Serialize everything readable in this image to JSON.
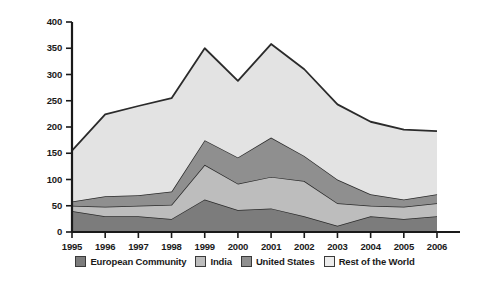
{
  "chart_data": {
    "type": "area",
    "stacked": true,
    "title": "",
    "subtitle": "",
    "xlabel": "",
    "ylabel": "Number of agreements",
    "categories": [
      "1995",
      "1996",
      "1997",
      "1998",
      "1999",
      "2000",
      "2001",
      "2002",
      "2003",
      "2004",
      "2005",
      "2006"
    ],
    "x": [
      1995,
      1996,
      1997,
      1998,
      1999,
      2000,
      2001,
      2002,
      2003,
      2004,
      2005,
      2006
    ],
    "ylim": [
      0,
      400
    ],
    "xlim": [
      1995,
      2006
    ],
    "yticks": [
      0,
      50,
      100,
      150,
      200,
      250,
      300,
      350,
      400
    ],
    "ytick_labels": [
      "0",
      "50",
      "100",
      "150",
      "200",
      "250",
      "300",
      "350",
      "400"
    ],
    "xticks": [
      1995,
      1996,
      1997,
      1998,
      1999,
      2000,
      2001,
      2002,
      2003,
      2004,
      2005,
      2006
    ],
    "grid": false,
    "legend_position": "bottom",
    "series": [
      {
        "name": "European Community",
        "color": "#7c7c7c",
        "values": [
          40,
          30,
          30,
          25,
          62,
          42,
          45,
          30,
          12,
          30,
          25,
          30
        ]
      },
      {
        "name": "India",
        "color": "#bdbdbd",
        "values": [
          10,
          18,
          20,
          27,
          66,
          50,
          60,
          67,
          43,
          20,
          23,
          25
        ]
      },
      {
        "name": "United States",
        "color": "#8f8f8f",
        "values": [
          8,
          20,
          20,
          25,
          47,
          50,
          75,
          48,
          45,
          22,
          14,
          17
        ]
      },
      {
        "name": "Rest of the World",
        "color": "#e3e3e3",
        "values": [
          97,
          156,
          170,
          178,
          175,
          146,
          178,
          165,
          143,
          138,
          133,
          120
        ]
      }
    ],
    "cumulative_totals": [
      155,
      224,
      240,
      255,
      350,
      288,
      358,
      310,
      243,
      210,
      195,
      192
    ]
  },
  "legend": {
    "items": [
      {
        "label": "European Community",
        "color": "#7c7c7c"
      },
      {
        "label": "India",
        "color": "#bdbdbd"
      },
      {
        "label": "United States",
        "color": "#8f8f8f"
      },
      {
        "label": "Rest of the World",
        "color": "#ececec"
      }
    ]
  },
  "colors": {
    "axis": "#1a1a1a",
    "line": "#2b2b2b",
    "background": "#ffffff"
  }
}
